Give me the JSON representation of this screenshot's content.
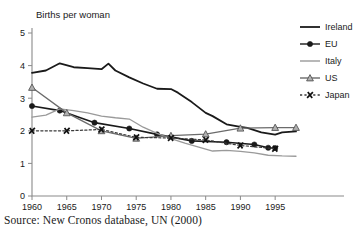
{
  "figure": {
    "axis_title": "Births per woman",
    "source_note": "Source: New Cronos database, UN (2000)"
  },
  "chart_data": {
    "type": "line",
    "title": "",
    "subtitle": "",
    "xlabel": "",
    "ylabel": "Births per woman",
    "xlim": [
      1960,
      1998
    ],
    "ylim": [
      0,
      5
    ],
    "yticks": [
      0,
      1,
      2,
      3,
      4,
      5
    ],
    "ytick_labels": [
      "0",
      "1",
      "2",
      "3",
      "4",
      "5"
    ],
    "xticks": [
      1960,
      1965,
      1970,
      1975,
      1980,
      1985,
      1990,
      1995
    ],
    "xtick_labels": [
      "1960",
      "1965",
      "1970",
      "1975",
      "1980",
      "1985",
      "1990",
      "1995"
    ],
    "grid": false,
    "legend_position": "top-right",
    "series": [
      {
        "name": "Ireland",
        "color": "#1a1a1a",
        "line_style": "solid",
        "line_width": 1.8,
        "marker": "none",
        "x": [
          1960,
          1962,
          1964,
          1966,
          1968,
          1970,
          1971,
          1972,
          1974,
          1976,
          1978,
          1980,
          1981,
          1983,
          1985,
          1986,
          1988,
          1990,
          1991,
          1993,
          1995,
          1996,
          1998
        ],
        "y": [
          3.78,
          3.85,
          4.07,
          3.95,
          3.92,
          3.89,
          4.06,
          3.85,
          3.64,
          3.45,
          3.29,
          3.28,
          3.17,
          2.88,
          2.55,
          2.45,
          2.2,
          2.12,
          2.09,
          1.95,
          1.88,
          1.95,
          1.98
        ]
      },
      {
        "name": "EU",
        "color": "#1a1a1a",
        "line_style": "solid",
        "line_width": 1.6,
        "marker": "circle",
        "x": [
          1960,
          1964,
          1969,
          1974,
          1978,
          1983,
          1988,
          1992,
          1994,
          1995
        ],
        "y": [
          2.76,
          2.62,
          2.25,
          2.07,
          1.89,
          1.69,
          1.65,
          1.58,
          1.48,
          1.47
        ]
      },
      {
        "name": "Italy",
        "color": "#9a9a9a",
        "line_style": "solid",
        "line_width": 1.3,
        "marker": "none",
        "x": [
          1960,
          1962,
          1964,
          1966,
          1968,
          1970,
          1972,
          1974,
          1976,
          1978,
          1980,
          1982,
          1984,
          1986,
          1988,
          1990,
          1992,
          1994,
          1996,
          1998
        ],
        "y": [
          2.42,
          2.48,
          2.67,
          2.62,
          2.55,
          2.45,
          2.4,
          2.36,
          2.11,
          1.92,
          1.76,
          1.62,
          1.5,
          1.38,
          1.4,
          1.37,
          1.32,
          1.25,
          1.23,
          1.22
        ]
      },
      {
        "name": "US",
        "color": "#6b6b6b",
        "line_style": "solid",
        "line_width": 1.3,
        "marker": "triangle",
        "x": [
          1960,
          1965,
          1970,
          1975,
          1980,
          1985,
          1990,
          1995,
          1998
        ],
        "y": [
          3.33,
          2.55,
          2.0,
          1.77,
          1.85,
          1.9,
          2.08,
          2.1,
          2.1
        ]
      },
      {
        "name": "Japan",
        "color": "#3a3a3a",
        "line_style": "dashed",
        "line_width": 1.2,
        "marker": "x",
        "x": [
          1960,
          1965,
          1970,
          1975,
          1980,
          1985,
          1990,
          1995
        ],
        "y": [
          2.0,
          2.0,
          2.04,
          1.8,
          1.78,
          1.72,
          1.55,
          1.45
        ]
      }
    ],
    "legend_entries": [
      {
        "label": "Ireland",
        "marker": "none",
        "line_style": "solid",
        "color": "#1a1a1a"
      },
      {
        "label": "EU",
        "marker": "circle",
        "line_style": "solid",
        "color": "#1a1a1a"
      },
      {
        "label": "Italy",
        "marker": "none",
        "line_style": "solid",
        "color": "#9a9a9a"
      },
      {
        "label": "US",
        "marker": "triangle",
        "line_style": "solid",
        "color": "#6b6b6b"
      },
      {
        "label": "Japan",
        "marker": "x",
        "line_style": "dashed",
        "color": "#3a3a3a"
      }
    ]
  }
}
